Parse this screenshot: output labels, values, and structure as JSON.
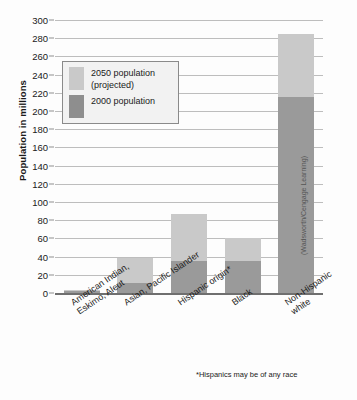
{
  "chart_data": {
    "type": "bar",
    "title": "",
    "xlabel": "",
    "ylabel": "Population in millions",
    "ylim": [
      0,
      300
    ],
    "ytick_step": 20,
    "yticks": [
      0,
      20,
      40,
      60,
      80,
      100,
      120,
      140,
      160,
      180,
      200,
      220,
      240,
      260,
      280,
      300
    ],
    "grid": true,
    "legend_position": "upper-left-inside",
    "categories": [
      "American Indian, Eskimo, Aleut",
      "Asian, Pacific Islander",
      "Hispanic origin*",
      "Black",
      "Non-Hispanic white"
    ],
    "category_lines": [
      [
        "American Indian,",
        "Eskimo, Aleut"
      ],
      [
        "Asian, Pacific Islander",
        ""
      ],
      [
        "Hispanic origin*",
        ""
      ],
      [
        "Black",
        ""
      ],
      [
        "Non-Hispanic",
        "white"
      ]
    ],
    "series": [
      {
        "name": "2050 population (projected)",
        "color": "#c9c9c9",
        "values": [
          3,
          38,
          87,
          61,
          285
        ]
      },
      {
        "name": "2000 population",
        "color": "#9a9a9a",
        "values": [
          2,
          11,
          35,
          35,
          215
        ]
      }
    ],
    "annotations": [
      "*Hispanics may be of any race"
    ],
    "credit": "(Wadsworth/Cengage Learning)"
  },
  "legend": {
    "items": [
      {
        "label_line1": "2050 population",
        "label_line2": "(projected)",
        "swatch": "light-gray-swatch"
      },
      {
        "label_line1": "2000 population",
        "label_line2": "",
        "swatch": "dark-gray-swatch"
      }
    ]
  },
  "colors": {
    "projected": "#c9c9c9",
    "base": "#9a9a9a",
    "gridline": "#bdbdbd",
    "axis": "#6f6f6f",
    "text": "#1a1a1a"
  }
}
